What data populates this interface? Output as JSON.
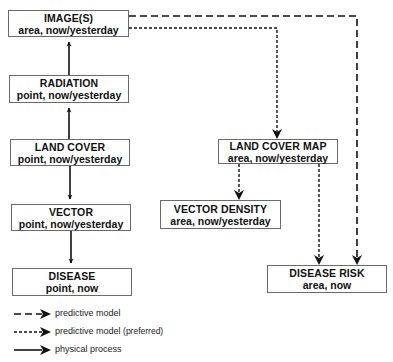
{
  "nodes": {
    "images": {
      "title": "IMAGE(S)",
      "sub": "area, now/yesterday"
    },
    "radiation": {
      "title": "RADIATION",
      "sub": "point, now/yesterday"
    },
    "land_cover": {
      "title": "LAND COVER",
      "sub": "point, now/yesterday"
    },
    "vector": {
      "title": "VECTOR",
      "sub": "point, now/yesterday"
    },
    "disease": {
      "title": "DISEASE",
      "sub": "point, now"
    },
    "land_cover_map": {
      "title": "LAND COVER MAP",
      "sub": "area, now/yesterday"
    },
    "vector_density": {
      "title": "VECTOR DENSITY",
      "sub": "area, now/yesterday"
    },
    "disease_risk": {
      "title": "DISEASE RISK",
      "sub": "area, now"
    }
  },
  "edges": [
    {
      "from": "land_cover",
      "to": "radiation",
      "type": "physical process"
    },
    {
      "from": "radiation",
      "to": "images",
      "type": "physical process"
    },
    {
      "from": "land_cover",
      "to": "vector",
      "type": "physical process"
    },
    {
      "from": "vector",
      "to": "disease",
      "type": "physical process"
    },
    {
      "from": "images",
      "to": "land_cover_map",
      "type": "predictive model (preferred)"
    },
    {
      "from": "land_cover_map",
      "to": "vector_density",
      "type": "predictive model (preferred)"
    },
    {
      "from": "land_cover_map",
      "to": "disease_risk",
      "type": "predictive model (preferred)"
    },
    {
      "from": "images",
      "to": "disease_risk",
      "type": "predictive model"
    }
  ],
  "legend": {
    "dashed": "predictive model",
    "dotted": "predictive model",
    "dotted_note": "(preferred)",
    "solid": "physical process"
  },
  "colors": {
    "line": "#111111",
    "box_border": "#6a6a6a",
    "background": "#ffffff"
  }
}
